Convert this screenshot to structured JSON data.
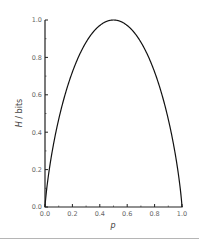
{
  "chart_data": {
    "type": "line",
    "title": "",
    "xlabel": "p",
    "ylabel": "H / bits",
    "xlim": [
      0.0,
      1.0
    ],
    "ylim": [
      0.0,
      1.0
    ],
    "grid": false,
    "legend": null,
    "x_ticks": [
      "0.0",
      "0.2",
      "0.4",
      "0.6",
      "0.8",
      "1.0"
    ],
    "y_ticks": [
      "0.0",
      "0.2",
      "0.4",
      "0.6",
      "0.8",
      "1.0"
    ],
    "series": [
      {
        "name": "Binary entropy H(p)",
        "x": [
          0.0,
          0.01,
          0.05,
          0.1,
          0.2,
          0.3,
          0.4,
          0.5,
          0.6,
          0.7,
          0.8,
          0.9,
          0.95,
          0.99,
          1.0
        ],
        "values": [
          0.0,
          0.081,
          0.286,
          0.469,
          0.722,
          0.881,
          0.971,
          1.0,
          0.971,
          0.881,
          0.722,
          0.469,
          0.286,
          0.081,
          0.0
        ]
      }
    ]
  },
  "colors": {
    "line": "#111111",
    "axis": "#222222",
    "tick_label": "#666666",
    "separator": "#b5b5b5"
  }
}
